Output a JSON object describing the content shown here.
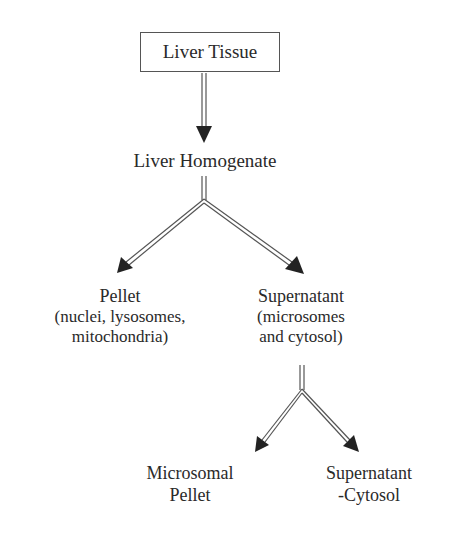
{
  "diagram": {
    "type": "flowchart",
    "title": "Liver Tissue",
    "nodes": {
      "root": {
        "label": "Liver Tissue"
      },
      "homogenate": {
        "label": "Liver Homogenate"
      },
      "pellet": {
        "label": "Pellet",
        "lines": [
          "(nuclei, lysosomes,",
          "mitochondria)"
        ]
      },
      "supernatant": {
        "label": "Supernatant",
        "lines": [
          "(microsomes",
          "and cytosol)"
        ]
      },
      "microsomal_pellet": {
        "lines": [
          "Microsomal",
          "Pellet"
        ]
      },
      "supernatant_cytosol": {
        "lines": [
          "Supernatant",
          "-Cytosol"
        ]
      }
    },
    "edges": [
      {
        "from": "Liver Tissue",
        "to": "Liver Homogenate"
      },
      {
        "from": "Liver Homogenate",
        "to": "Pellet"
      },
      {
        "from": "Liver Homogenate",
        "to": "Supernatant"
      },
      {
        "from": "Supernatant",
        "to": "Microsomal Pellet"
      },
      {
        "from": "Supernatant",
        "to": "Supernatant-Cytosol"
      }
    ],
    "colors": {
      "line": "#444444",
      "text": "#2a2a2a",
      "background": "#ffffff"
    }
  }
}
